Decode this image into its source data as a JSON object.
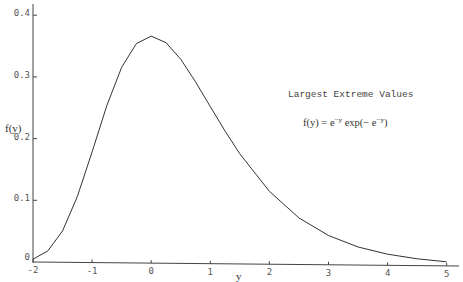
{
  "chart_data": {
    "type": "line",
    "title": "Largest Extreme Values",
    "annotation": {
      "formula_prefix": "f(y) = e",
      "formula_sup1": "−y",
      "formula_mid": " exp(− e",
      "formula_sup2": "−y",
      "formula_suffix": ")"
    },
    "xlabel": "y",
    "ylabel": "f(y)",
    "xlim": [
      -2,
      5
    ],
    "ylim": [
      0,
      0.4
    ],
    "grid": false,
    "legend": null,
    "x_ticks": [
      {
        "value": -2,
        "label": "-2"
      },
      {
        "value": -1,
        "label": "-1"
      },
      {
        "value": 0,
        "label": "0"
      },
      {
        "value": 1,
        "label": "1"
      },
      {
        "value": 2,
        "label": "2"
      },
      {
        "value": 3,
        "label": "3"
      },
      {
        "value": 4,
        "label": "4"
      },
      {
        "value": 5,
        "label": "5"
      }
    ],
    "y_ticks": [
      {
        "value": 0,
        "label": "0"
      },
      {
        "value": 0.1,
        "label": "0.1"
      },
      {
        "value": 0.2,
        "label": "0.2"
      },
      {
        "value": 0.3,
        "label": "0.3"
      },
      {
        "value": 0.4,
        "label": "0.4"
      }
    ],
    "series": [
      {
        "name": "f(y) = e^-y exp(-e^-y)",
        "x": [
          -2,
          -1.75,
          -1.5,
          -1.25,
          -1,
          -0.75,
          -0.5,
          -0.25,
          0,
          0.25,
          0.5,
          0.75,
          1,
          1.25,
          1.5,
          2,
          2.5,
          3,
          3.5,
          4,
          4.5,
          5
        ],
        "y": [
          0.0046,
          0.0182,
          0.0507,
          0.1065,
          0.1794,
          0.2549,
          0.317,
          0.3556,
          0.3679,
          0.3575,
          0.3307,
          0.2946,
          0.2546,
          0.2151,
          0.1785,
          0.1182,
          0.0756,
          0.0474,
          0.0293,
          0.018,
          0.011,
          0.0067
        ]
      }
    ],
    "colors": {
      "line": "#333333",
      "axis": "#444444",
      "background": "#ffffff"
    }
  }
}
